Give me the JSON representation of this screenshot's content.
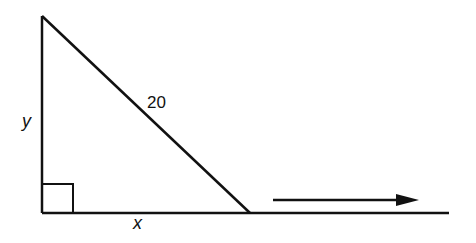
{
  "diagram": {
    "type": "right-triangle-with-motion-arrow",
    "labels": {
      "hypotenuse": "20",
      "vertical_leg": "y",
      "horizontal_leg": "x"
    },
    "right_angle_marker": true,
    "motion_arrow_direction": "right",
    "colors": {
      "stroke": "#111111",
      "background": "#ffffff"
    }
  }
}
